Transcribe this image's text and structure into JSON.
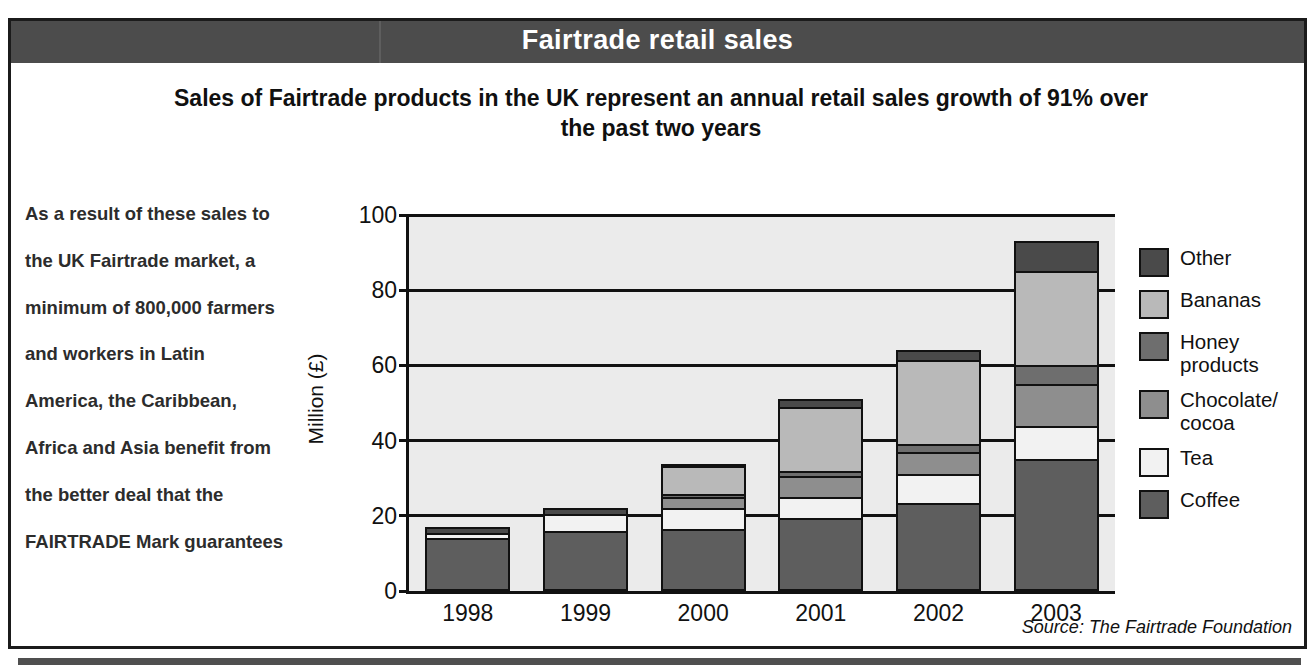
{
  "header": {
    "title": "Fairtrade retail sales"
  },
  "subtitle": "Sales of Fairtrade products in the UK represent an annual retail sales growth of 91% over the past two years",
  "side_note": "As a result of these sales to the UK Fairtrade market, a minimum of 800,000 farmers and workers in Latin America, the Caribbean, Africa and Asia benefit from the better deal that the FAIRTRADE Mark guarantees",
  "source": "Source: The Fairtrade Foundation",
  "colors": {
    "header_band": "#4c4c4c",
    "plot_background": "#ebebeb",
    "axis": "#111111",
    "other": "#4a4a4a",
    "bananas": "#b9b9b9",
    "honey_products": "#6e6e6e",
    "chocolate_cocoa": "#8e8e8e",
    "tea": "#f2f2f2",
    "coffee": "#5e5e5e"
  },
  "chart_data": {
    "type": "bar",
    "stacked": true,
    "title": "Fairtrade retail sales",
    "xlabel": "",
    "ylabel": "Million (£)",
    "ylim": [
      0,
      100
    ],
    "yticks": [
      0,
      20,
      40,
      60,
      80,
      100
    ],
    "grid": true,
    "legend_position": "right",
    "categories": [
      "1998",
      "1999",
      "2000",
      "2001",
      "2002",
      "2003"
    ],
    "series": [
      {
        "name": "Coffee",
        "color": "#5e5e5e",
        "values": [
          14.0,
          16.0,
          16.5,
          19.5,
          23.5,
          35.0
        ]
      },
      {
        "name": "Tea",
        "color": "#f2f2f2",
        "values": [
          1.5,
          4.5,
          5.5,
          5.5,
          7.5,
          9.0
        ]
      },
      {
        "name": "Chocolate/ cocoa",
        "color": "#8e8e8e",
        "values": [
          0.0,
          0.0,
          3.0,
          5.5,
          6.0,
          11.0
        ]
      },
      {
        "name": "Honey products",
        "color": "#6e6e6e",
        "values": [
          0.0,
          0.0,
          0.7,
          1.5,
          2.0,
          5.0
        ]
      },
      {
        "name": "Bananas",
        "color": "#b9b9b9",
        "values": [
          0.0,
          0.0,
          7.5,
          17.0,
          22.5,
          25.0
        ]
      },
      {
        "name": "Other",
        "color": "#4a4a4a",
        "values": [
          1.5,
          1.5,
          0.3,
          2.0,
          2.5,
          8.0
        ]
      }
    ],
    "totals": [
      17.0,
      22.0,
      33.5,
      51.0,
      64.0,
      93.0
    ]
  },
  "legend": {
    "items": [
      {
        "label": "Other",
        "color": "#4a4a4a"
      },
      {
        "label": "Bananas",
        "color": "#b9b9b9"
      },
      {
        "label": "Honey products",
        "color": "#6e6e6e"
      },
      {
        "label": "Chocolate/ cocoa",
        "color": "#8e8e8e"
      },
      {
        "label": "Tea",
        "color": "#f2f2f2"
      },
      {
        "label": "Coffee",
        "color": "#5e5e5e"
      }
    ]
  }
}
